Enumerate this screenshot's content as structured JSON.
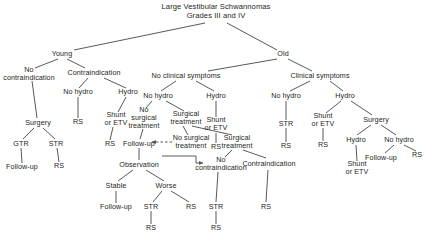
{
  "diagram": {
    "title": "Large Vestibular Schwannomas\nGrades III and IV",
    "colors": {
      "text": "#231f20",
      "edge": "#58595b",
      "background": "#ffffff"
    },
    "nodes": [
      {
        "id": "root",
        "label": "Large Vestibular Schwannomas\nGrades III and IV",
        "x": 216,
        "y": 12,
        "title": true
      },
      {
        "id": "young",
        "label": "Young",
        "x": 62,
        "y": 54
      },
      {
        "id": "old",
        "label": "Old",
        "x": 283,
        "y": 54
      },
      {
        "id": "no_contra_l",
        "label": "No\ncontraindication",
        "x": 29,
        "y": 74
      },
      {
        "id": "contra_l",
        "label": "Contraindication",
        "x": 94,
        "y": 73
      },
      {
        "id": "no_clin",
        "label": "No clinical symptoms",
        "x": 186,
        "y": 76
      },
      {
        "id": "clin",
        "label": "Clinical symptoms",
        "x": 320,
        "y": 76
      },
      {
        "id": "nohydro_l",
        "label": "No hydro",
        "x": 78,
        "y": 92
      },
      {
        "id": "hydro_l",
        "label": "Hydro",
        "x": 128,
        "y": 92
      },
      {
        "id": "nohydro_c",
        "label": "No hydro",
        "x": 158,
        "y": 96
      },
      {
        "id": "hydro_c",
        "label": "Hydro",
        "x": 216,
        "y": 96
      },
      {
        "id": "nohydro_r",
        "label": "No hydro",
        "x": 286,
        "y": 96
      },
      {
        "id": "hydro_r",
        "label": "Hydro",
        "x": 345,
        "y": 96
      },
      {
        "id": "surgery_l",
        "label": "Surgery",
        "x": 38,
        "y": 123
      },
      {
        "id": "rs_nohydro_l",
        "label": "RS",
        "x": 78,
        "y": 122
      },
      {
        "id": "shunt_l",
        "label": "Shunt\nor ETV",
        "x": 116,
        "y": 119
      },
      {
        "id": "nosurg_c1",
        "label": "No\nsurgical\ntreatment",
        "x": 144,
        "y": 118
      },
      {
        "id": "surgtx_c",
        "label": "Surgical\ntreatment",
        "x": 186,
        "y": 118
      },
      {
        "id": "shunt_c",
        "label": "Shunt\nor ETV",
        "x": 216,
        "y": 124
      },
      {
        "id": "str_r1",
        "label": "STR",
        "x": 286,
        "y": 124
      },
      {
        "id": "shunt_r",
        "label": "Shunt\nor ETV",
        "x": 323,
        "y": 120
      },
      {
        "id": "surgery_r",
        "label": "Surgery",
        "x": 376,
        "y": 120
      },
      {
        "id": "gtr",
        "label": "GTR",
        "x": 21,
        "y": 144
      },
      {
        "id": "str_l",
        "label": "STR",
        "x": 56,
        "y": 144
      },
      {
        "id": "rs_shunt_l",
        "label": "RS",
        "x": 110,
        "y": 144
      },
      {
        "id": "followup_l",
        "label": "Follow-up",
        "x": 139,
        "y": 144
      },
      {
        "id": "nosurg_c2",
        "label": "No surgical\ntreatment",
        "x": 191,
        "y": 142
      },
      {
        "id": "surgtx_c2",
        "label": "Surgical\ntreatment",
        "x": 237,
        "y": 142
      },
      {
        "id": "rs_shunt_c",
        "label": "RS",
        "x": 216,
        "y": 147
      },
      {
        "id": "rs_clin_nohydro",
        "label": "RS",
        "x": 286,
        "y": 146
      },
      {
        "id": "rs_shunt_r",
        "label": "RS",
        "x": 323,
        "y": 145
      },
      {
        "id": "hydro_r2",
        "label": "Hydro",
        "x": 356,
        "y": 140
      },
      {
        "id": "nohydro_r2",
        "label": "No hydro",
        "x": 399,
        "y": 140
      },
      {
        "id": "followup_gtr",
        "label": "Follow-up",
        "x": 22,
        "y": 167
      },
      {
        "id": "rs_str_l",
        "label": "RS",
        "x": 59,
        "y": 166
      },
      {
        "id": "observation",
        "label": "Observation",
        "x": 139,
        "y": 165
      },
      {
        "id": "no_contra_c",
        "label": "No\ncontraindication",
        "x": 221,
        "y": 164
      },
      {
        "id": "contra_c",
        "label": "Contraindication",
        "x": 269,
        "y": 164
      },
      {
        "id": "followup_r",
        "label": "Follow-up",
        "x": 381,
        "y": 158
      },
      {
        "id": "rs_nohydro_r",
        "label": "RS",
        "x": 417,
        "y": 155
      },
      {
        "id": "shunt_r2",
        "label": "Shunt\nor ETV",
        "x": 357,
        "y": 168
      },
      {
        "id": "stable",
        "label": "Stable",
        "x": 116,
        "y": 186
      },
      {
        "id": "worse",
        "label": "Worse",
        "x": 166,
        "y": 186
      },
      {
        "id": "followup_stable",
        "label": "Follow-up",
        "x": 116,
        "y": 207
      },
      {
        "id": "str_worse",
        "label": "STR",
        "x": 151,
        "y": 207
      },
      {
        "id": "rs_worse",
        "label": "RS",
        "x": 191,
        "y": 207
      },
      {
        "id": "str_nocontra_c",
        "label": "STR",
        "x": 216,
        "y": 207
      },
      {
        "id": "rs_contra_c",
        "label": "RS",
        "x": 266,
        "y": 207
      },
      {
        "id": "rs_str_worse",
        "label": "RS",
        "x": 151,
        "y": 228
      },
      {
        "id": "rs_str_nocontra",
        "label": "RS",
        "x": 216,
        "y": 228
      }
    ],
    "edges": [
      {
        "from": "root",
        "to": "young",
        "x1": 205,
        "y1": 23,
        "x2": 74,
        "y2": 50
      },
      {
        "from": "root",
        "to": "old",
        "x1": 227,
        "y1": 23,
        "x2": 277,
        "y2": 50
      },
      {
        "from": "young",
        "to": "no_contra_l",
        "x1": 58,
        "y1": 59,
        "x2": 35,
        "y2": 68
      },
      {
        "from": "young",
        "to": "contra_l",
        "x1": 67,
        "y1": 59,
        "x2": 85,
        "y2": 68
      },
      {
        "from": "old",
        "to": "no_clin",
        "x1": 277,
        "y1": 59,
        "x2": 208,
        "y2": 71
      },
      {
        "from": "old",
        "to": "clin",
        "x1": 288,
        "y1": 59,
        "x2": 312,
        "y2": 71
      },
      {
        "from": "contra_l",
        "to": "nohydro_l",
        "x1": 88,
        "y1": 78,
        "x2": 79,
        "y2": 88
      },
      {
        "from": "contra_l",
        "to": "hydro_l",
        "x1": 104,
        "y1": 78,
        "x2": 126,
        "y2": 88
      },
      {
        "from": "no_clin",
        "to": "nohydro_c",
        "x1": 176,
        "y1": 81,
        "x2": 161,
        "y2": 91
      },
      {
        "from": "no_clin",
        "to": "hydro_c",
        "x1": 196,
        "y1": 81,
        "x2": 214,
        "y2": 91
      },
      {
        "from": "clin",
        "to": "nohydro_r",
        "x1": 310,
        "y1": 81,
        "x2": 290,
        "y2": 91
      },
      {
        "from": "clin",
        "to": "hydro_r",
        "x1": 330,
        "y1": 81,
        "x2": 343,
        "y2": 91
      },
      {
        "from": "no_contra_l",
        "to": "surgery_l",
        "x1": 32,
        "y1": 81,
        "x2": 37,
        "y2": 118
      },
      {
        "from": "nohydro_l",
        "to": "rs_nohydro_l",
        "x1": 78,
        "y1": 97,
        "x2": 78,
        "y2": 118
      },
      {
        "from": "hydro_l",
        "to": "shunt_l",
        "x1": 126,
        "y1": 97,
        "x2": 118,
        "y2": 112
      },
      {
        "from": "nohydro_c",
        "to": "nosurg_c1",
        "x1": 152,
        "y1": 101,
        "x2": 146,
        "y2": 108
      },
      {
        "from": "nohydro_c",
        "to": "surgtx_c",
        "x1": 166,
        "y1": 101,
        "x2": 184,
        "y2": 111
      },
      {
        "from": "hydro_c",
        "to": "shunt_c",
        "x1": 216,
        "y1": 101,
        "x2": 216,
        "y2": 117
      },
      {
        "from": "nohydro_r",
        "to": "str_r1",
        "x1": 286,
        "y1": 101,
        "x2": 286,
        "y2": 120
      },
      {
        "from": "hydro_r",
        "to": "shunt_r",
        "x1": 341,
        "y1": 101,
        "x2": 326,
        "y2": 113
      },
      {
        "from": "hydro_r",
        "to": "surgery_r",
        "x1": 351,
        "y1": 101,
        "x2": 372,
        "y2": 115
      },
      {
        "from": "surgery_l",
        "to": "gtr",
        "x1": 34,
        "y1": 128,
        "x2": 23,
        "y2": 139
      },
      {
        "from": "surgery_l",
        "to": "str_l",
        "x1": 43,
        "y1": 128,
        "x2": 55,
        "y2": 139
      },
      {
        "from": "shunt_l",
        "to": "rs_shunt_l",
        "x1": 113,
        "y1": 127,
        "x2": 110,
        "y2": 140
      },
      {
        "from": "nosurg_c1",
        "to": "followup_l",
        "x1": 143,
        "y1": 129,
        "x2": 140,
        "y2": 139
      },
      {
        "from": "surgtx_c",
        "to": "nosurg_c2",
        "x1": 183,
        "y1": 126,
        "x2": 188,
        "y2": 135
      },
      {
        "from": "surgtx_c",
        "to": "surgtx_c2",
        "x1": 192,
        "y1": 126,
        "x2": 232,
        "y2": 135
      },
      {
        "from": "shunt_c",
        "to": "rs_shunt_c",
        "x1": 216,
        "y1": 133,
        "x2": 216,
        "y2": 143
      },
      {
        "from": "str_r1",
        "to": "rs_clin_nohydro",
        "x1": 286,
        "y1": 128,
        "x2": 286,
        "y2": 142
      },
      {
        "from": "shunt_r",
        "to": "rs_shunt_r",
        "x1": 323,
        "y1": 128,
        "x2": 323,
        "y2": 141
      },
      {
        "from": "surgery_r",
        "to": "hydro_r2",
        "x1": 371,
        "y1": 125,
        "x2": 357,
        "y2": 135
      },
      {
        "from": "surgery_r",
        "to": "nohydro_r2",
        "x1": 381,
        "y1": 125,
        "x2": 396,
        "y2": 135
      },
      {
        "from": "gtr",
        "to": "followup_gtr",
        "x1": 21,
        "y1": 148,
        "x2": 22,
        "y2": 163
      },
      {
        "from": "str_l",
        "to": "rs_str_l",
        "x1": 57,
        "y1": 148,
        "x2": 59,
        "y2": 162
      },
      {
        "from": "followup_l",
        "to": "observation",
        "x1": 139,
        "y1": 148,
        "x2": 139,
        "y2": 160
      },
      {
        "from": "surgtx_c2",
        "to": "no_contra_c",
        "x1": 232,
        "y1": 150,
        "x2": 225,
        "y2": 157
      },
      {
        "from": "surgtx_c2",
        "to": "contra_c",
        "x1": 243,
        "y1": 150,
        "x2": 266,
        "y2": 158
      },
      {
        "from": "hydro_r2",
        "to": "shunt_r2",
        "x1": 356,
        "y1": 145,
        "x2": 357,
        "y2": 161
      },
      {
        "from": "nohydro_r2",
        "to": "followup_r",
        "x1": 394,
        "y1": 145,
        "x2": 385,
        "y2": 153
      },
      {
        "from": "nohydro_r2",
        "to": "rs_nohydro_r",
        "x1": 404,
        "y1": 145,
        "x2": 416,
        "y2": 151
      },
      {
        "from": "observation",
        "to": "stable",
        "x1": 133,
        "y1": 170,
        "x2": 118,
        "y2": 181
      },
      {
        "from": "observation",
        "to": "worse",
        "x1": 146,
        "y1": 170,
        "x2": 164,
        "y2": 181
      },
      {
        "from": "stable",
        "to": "followup_stable",
        "x1": 116,
        "y1": 191,
        "x2": 116,
        "y2": 203
      },
      {
        "from": "worse",
        "to": "str_worse",
        "x1": 162,
        "y1": 191,
        "x2": 153,
        "y2": 202
      },
      {
        "from": "worse",
        "to": "rs_worse",
        "x1": 171,
        "y1": 191,
        "x2": 189,
        "y2": 202
      },
      {
        "from": "no_contra_c",
        "to": "str_nocontra_c",
        "x1": 218,
        "y1": 172,
        "x2": 216,
        "y2": 202
      },
      {
        "from": "contra_c",
        "to": "rs_contra_c",
        "x1": 268,
        "y1": 170,
        "x2": 266,
        "y2": 202
      },
      {
        "from": "str_worse",
        "to": "rs_str_worse",
        "x1": 151,
        "y1": 211,
        "x2": 151,
        "y2": 224
      },
      {
        "from": "str_nocontra_c",
        "to": "rs_str_nocontra",
        "x1": 216,
        "y1": 211,
        "x2": 216,
        "y2": 224
      }
    ],
    "arrow_edges": [
      {
        "from": "nosurg_c2",
        "to": "followup_l",
        "dashed": true,
        "x1": 172,
        "y1": 142,
        "x2": 152,
        "y2": 142
      },
      {
        "from": "surgtx_c",
        "to": "no_contra_c",
        "dashed": false,
        "path": "M 162 156 L 196 156 L 196 163 L 203 163"
      }
    ]
  }
}
